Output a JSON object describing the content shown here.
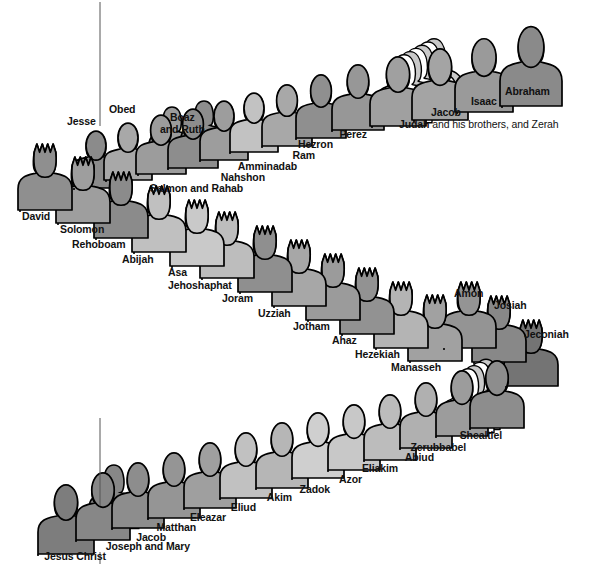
{
  "figure": {
    "kind": "pictorial-genealogy-diagram",
    "background_color": "#ffffff",
    "outline_color": "#000000",
    "label_color": "#111111",
    "divider_line_color": "#555555",
    "partial_top_text": "..."
  },
  "palette": {
    "darkest": "#6e6e6e",
    "dark": "#7f7f7f",
    "mid_dark": "#919191",
    "mid": "#a0a0a0",
    "mid_light": "#b3b3b3",
    "light": "#c6c6c6",
    "lighter": "#d6d6d6",
    "white": "#ffffff"
  },
  "rows": [
    {
      "name": "row-1-abraham-to-jesse",
      "reading_order": "right-to-left (Abraham at right, descending to Jesse at left)",
      "people": [
        {
          "name": "Abraham",
          "label": "Abraham",
          "crowned": false,
          "shade": "#8a8a8a",
          "x": 500,
          "y": 28,
          "w": 62,
          "h": 78,
          "label_x": 505,
          "label_y": 86,
          "align": "left",
          "stack": 0
        },
        {
          "name": "Isaac",
          "label": "Isaac",
          "crowned": false,
          "shade": "#9a9a9a",
          "x": 455,
          "y": 40,
          "w": 58,
          "h": 72,
          "label_x": 471,
          "label_y": 96,
          "align": "left",
          "stack": 0
        },
        {
          "name": "Jacob",
          "label": "Jacob",
          "crowned": false,
          "shade": "#a4a4a4",
          "x": 412,
          "y": 50,
          "w": 56,
          "h": 70,
          "label_x": 431,
          "label_y": 107,
          "align": "left",
          "stack": 0
        },
        {
          "name": "Judah",
          "label": "Judah",
          "label_suffix": " and his brothers, and Zerah",
          "crowned": false,
          "shade": "#a0a0a0",
          "x": 370,
          "y": 58,
          "w": 56,
          "h": 68,
          "label_x": 399,
          "label_y": 119,
          "align": "left",
          "stack": 6
        },
        {
          "name": "Perez",
          "label": "Perez",
          "crowned": false,
          "shade": "#979797",
          "x": 332,
          "y": 66,
          "w": 52,
          "h": 64,
          "label_x": 367,
          "label_y": 129,
          "align": "right",
          "stack": 0
        },
        {
          "name": "Hezron",
          "label": "Hezron",
          "crowned": false,
          "shade": "#8f8f8f",
          "x": 296,
          "y": 76,
          "w": 50,
          "h": 62,
          "label_x": 333,
          "label_y": 139,
          "align": "right",
          "stack": 0
        },
        {
          "name": "Ram",
          "label": "Ram",
          "crowned": false,
          "shade": "#a8a8a8",
          "x": 262,
          "y": 86,
          "w": 50,
          "h": 60,
          "label_x": 315,
          "label_y": 150,
          "align": "right",
          "stack": 0
        },
        {
          "name": "Amminadab",
          "label": "Amminadab",
          "crowned": false,
          "shade": "#c2c2c2",
          "x": 230,
          "y": 94,
          "w": 48,
          "h": 58,
          "label_x": 297,
          "label_y": 161,
          "align": "right",
          "stack": 0
        },
        {
          "name": "Nahshon",
          "label": "Nahshon",
          "crowned": false,
          "shade": "#9d9d9d",
          "x": 200,
          "y": 102,
          "w": 48,
          "h": 58,
          "label_x": 265,
          "label_y": 172,
          "align": "right",
          "stack": 0
        },
        {
          "name": "Salmon and Rahab",
          "label": "Salmon and Rahab",
          "crowned": false,
          "shade": "#8d8d8d",
          "x": 168,
          "y": 110,
          "w": 50,
          "h": 58,
          "label_x": 243,
          "label_y": 183,
          "align": "right",
          "stack": 0,
          "couple": true
        },
        {
          "name": "Boaz and Ruth",
          "label": "Boaz\nand Ruth",
          "crowned": false,
          "shade": "#9c9c9c",
          "x": 136,
          "y": 116,
          "w": 50,
          "h": 58,
          "label_x": 160,
          "label_y": 112,
          "align": "above",
          "stack": 0,
          "couple": true
        },
        {
          "name": "Obed",
          "label": "Obed",
          "crowned": false,
          "shade": "#a8a8a8",
          "x": 104,
          "y": 124,
          "w": 48,
          "h": 56,
          "label_x": 109,
          "label_y": 104,
          "align": "above",
          "stack": 0
        },
        {
          "name": "Jesse",
          "label": "Jesse",
          "crowned": false,
          "shade": "#8b8b8b",
          "x": 72,
          "y": 132,
          "w": 48,
          "h": 56,
          "label_x": 67,
          "label_y": 116,
          "align": "above",
          "stack": 0
        }
      ]
    },
    {
      "name": "row-2-david-to-jeconiah",
      "reading_order": "left-to-right (David at left, descending to Jeconiah at right)",
      "people": [
        {
          "name": "David",
          "label": "David",
          "crowned": true,
          "shade": "#8f8f8f",
          "x": 18,
          "y": 144,
          "w": 54,
          "h": 66,
          "label_x": 22,
          "label_y": 211,
          "align": "left",
          "stack": 0
        },
        {
          "name": "Solomon",
          "label": "Solomon",
          "crowned": true,
          "shade": "#9e9e9e",
          "x": 56,
          "y": 157,
          "w": 54,
          "h": 66,
          "label_x": 60,
          "label_y": 224,
          "align": "left",
          "stack": 0
        },
        {
          "name": "Rehoboam",
          "label": "Rehoboam",
          "crowned": true,
          "shade": "#8b8b8b",
          "x": 94,
          "y": 172,
          "w": 54,
          "h": 66,
          "label_x": 72,
          "label_y": 239,
          "align": "left",
          "stack": 0
        },
        {
          "name": "Abijah",
          "label": "Abijah",
          "crowned": true,
          "shade": "#c0c0c0",
          "x": 132,
          "y": 186,
          "w": 54,
          "h": 66,
          "label_x": 122,
          "label_y": 254,
          "align": "left",
          "stack": 0
        },
        {
          "name": "Asa",
          "label": "Asa",
          "crowned": true,
          "shade": "#c9c9c9",
          "x": 170,
          "y": 200,
          "w": 54,
          "h": 66,
          "label_x": 168,
          "label_y": 267,
          "align": "left",
          "stack": 0
        },
        {
          "name": "Jehoshaphat",
          "label": "Jehoshaphat",
          "crowned": true,
          "shade": "#bdbdbd",
          "x": 200,
          "y": 212,
          "w": 54,
          "h": 66,
          "label_x": 168,
          "label_y": 280,
          "align": "left",
          "stack": 0
        },
        {
          "name": "Joram",
          "label": "Joram",
          "crowned": true,
          "shade": "#8f8f8f",
          "x": 238,
          "y": 226,
          "w": 54,
          "h": 66,
          "label_x": 222,
          "label_y": 293,
          "align": "left",
          "stack": 0
        },
        {
          "name": "Uzziah",
          "label": "Uzziah",
          "crowned": true,
          "shade": "#a7a7a7",
          "x": 272,
          "y": 240,
          "w": 54,
          "h": 66,
          "label_x": 258,
          "label_y": 308,
          "align": "left",
          "stack": 0
        },
        {
          "name": "Jotham",
          "label": "Jotham",
          "crowned": true,
          "shade": "#9b9b9b",
          "x": 306,
          "y": 254,
          "w": 54,
          "h": 66,
          "label_x": 293,
          "label_y": 321,
          "align": "left",
          "stack": 0
        },
        {
          "name": "Ahaz",
          "label": "Ahaz",
          "crowned": true,
          "shade": "#929292",
          "x": 340,
          "y": 268,
          "w": 54,
          "h": 66,
          "label_x": 332,
          "label_y": 335,
          "align": "left",
          "stack": 0
        },
        {
          "name": "Hezekiah",
          "label": "Hezekiah",
          "crowned": true,
          "shade": "#b4b4b4",
          "x": 374,
          "y": 282,
          "w": 54,
          "h": 66,
          "label_x": 355,
          "label_y": 349,
          "align": "left",
          "stack": 0
        },
        {
          "name": "Manasseh",
          "label": "Manasseh",
          "crowned": true,
          "shade": "#a1a1a1",
          "x": 408,
          "y": 295,
          "w": 54,
          "h": 66,
          "label_x": 391,
          "label_y": 362,
          "align": "left",
          "stack": 0
        },
        {
          "name": "Amon",
          "label": "Amon",
          "crowned": true,
          "shade": "#949494",
          "x": 442,
          "y": 282,
          "w": 54,
          "h": 66,
          "label_x": 454,
          "label_y": 288,
          "align": "above",
          "stack": 0
        },
        {
          "name": "Josiah",
          "label": "Josiah",
          "crowned": true,
          "shade": "#888888",
          "x": 472,
          "y": 296,
          "w": 54,
          "h": 66,
          "label_x": 494,
          "label_y": 300,
          "align": "above",
          "stack": 0
        },
        {
          "name": "Jeconiah",
          "label": "Jeconiah",
          "crowned": true,
          "shade": "#747474",
          "x": 504,
          "y": 320,
          "w": 54,
          "h": 66,
          "label_x": 524,
          "label_y": 329,
          "align": "above",
          "stack": 0
        }
      ]
    },
    {
      "name": "row-3-shealtiel-to-jesus",
      "reading_order": "right-to-left (Shealtiel at right, descending to Jesus Christ at left)",
      "people": [
        {
          "name": "Shealtiel",
          "label": "Shealtiel",
          "crowned": false,
          "shade": "#8d8d8d",
          "x": 470,
          "y": 362,
          "w": 54,
          "h": 66,
          "label_x": 502,
          "label_y": 430,
          "align": "right",
          "stack": 0
        },
        {
          "name": "Zerubbabel",
          "label": "Zerubbabel",
          "crowned": false,
          "shade": "#9c9c9c",
          "x": 436,
          "y": 372,
          "w": 52,
          "h": 64,
          "label_x": 466,
          "label_y": 442,
          "align": "right",
          "stack": 4
        },
        {
          "name": "Abiud",
          "label": "Abiud",
          "crowned": false,
          "shade": "#b0b0b0",
          "x": 400,
          "y": 384,
          "w": 52,
          "h": 64,
          "label_x": 434,
          "label_y": 452,
          "align": "right",
          "stack": 0
        },
        {
          "name": "Eliakim",
          "label": "Eliakim",
          "crowned": false,
          "shade": "#bcbcbc",
          "x": 364,
          "y": 396,
          "w": 52,
          "h": 64,
          "label_x": 398,
          "label_y": 463,
          "align": "right",
          "stack": 0
        },
        {
          "name": "Azor",
          "label": "Azor",
          "crowned": false,
          "shade": "#c8c8c8",
          "x": 328,
          "y": 406,
          "w": 52,
          "h": 64,
          "label_x": 362,
          "label_y": 474,
          "align": "right",
          "stack": 0
        },
        {
          "name": "Zadok",
          "label": "Zadok",
          "crowned": false,
          "shade": "#cfcfcf",
          "x": 292,
          "y": 414,
          "w": 52,
          "h": 64,
          "label_x": 330,
          "label_y": 484,
          "align": "right",
          "stack": 0
        },
        {
          "name": "Akim",
          "label": "Akim",
          "crowned": false,
          "shade": "#b6b6b6",
          "x": 256,
          "y": 424,
          "w": 52,
          "h": 64,
          "label_x": 292,
          "label_y": 492,
          "align": "right",
          "stack": 0
        },
        {
          "name": "Eliud",
          "label": "Eliud",
          "crowned": false,
          "shade": "#c1c1c1",
          "x": 220,
          "y": 434,
          "w": 52,
          "h": 64,
          "label_x": 256,
          "label_y": 502,
          "align": "right",
          "stack": 0
        },
        {
          "name": "Eleazar",
          "label": "Eleazar",
          "crowned": false,
          "shade": "#9f9f9f",
          "x": 184,
          "y": 444,
          "w": 52,
          "h": 64,
          "label_x": 226,
          "label_y": 512,
          "align": "right",
          "stack": 0
        },
        {
          "name": "Matthan",
          "label": "Matthan",
          "crowned": false,
          "shade": "#959595",
          "x": 148,
          "y": 454,
          "w": 52,
          "h": 64,
          "label_x": 196,
          "label_y": 522,
          "align": "right",
          "stack": 0
        },
        {
          "name": "Jacob",
          "label": "Jacob",
          "crowned": false,
          "shade": "#8d8d8d",
          "x": 112,
          "y": 464,
          "w": 52,
          "h": 64,
          "label_x": 166,
          "label_y": 532,
          "align": "right",
          "stack": 0
        },
        {
          "name": "Joseph and Mary",
          "label": "Joseph and Mary",
          "crowned": false,
          "shade": "#878787",
          "x": 76,
          "y": 474,
          "w": 54,
          "h": 66,
          "label_x": 190,
          "label_y": 541,
          "align": "right",
          "stack": 0,
          "couple": true
        },
        {
          "name": "Jesus Christ",
          "label": "Jesus Christ",
          "crowned": false,
          "shade": "#7d7d7d",
          "x": 38,
          "y": 486,
          "w": 56,
          "h": 68,
          "label_x": 106,
          "label_y": 551,
          "align": "right",
          "stack": 0
        }
      ]
    }
  ],
  "divider_lines": [
    {
      "name": "upper-divider",
      "x": 100,
      "y1": 2,
      "y2": 126
    },
    {
      "name": "lower-divider",
      "x": 100,
      "y1": 418,
      "y2": 506
    },
    {
      "name": "lower-tick",
      "x": 100,
      "y1": 552,
      "y2": 564
    }
  ],
  "counts": {
    "total_named_figures": 41,
    "crowned_kings": 15,
    "rows": 3
  }
}
